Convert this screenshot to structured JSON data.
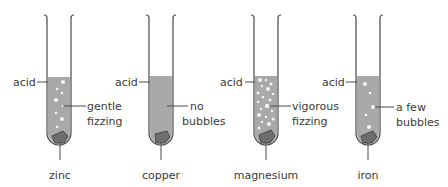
{
  "colors": {
    "liquid": "#a9a9a9",
    "tube_outline": "#4a4a4a",
    "metal": "#6e6e6e",
    "bubble": "#f4f4f4",
    "text": "#3a3a3a"
  },
  "tubes": [
    {
      "id": "zinc",
      "acid_label": "acid",
      "observation_line1": "gentle",
      "observation_line2": "fizzing",
      "metal_label": "zinc"
    },
    {
      "id": "copper",
      "acid_label": "acid",
      "observation_line1": "no",
      "observation_line2": "bubbles",
      "metal_label": "copper"
    },
    {
      "id": "magnesium",
      "acid_label": "acid",
      "observation_line1": "vigorous",
      "observation_line2": "fizzing",
      "metal_label": "magnesium"
    },
    {
      "id": "iron",
      "acid_label": "acid",
      "observation_line1": "a few",
      "observation_line2": "bubbles",
      "metal_label": "iron"
    }
  ]
}
